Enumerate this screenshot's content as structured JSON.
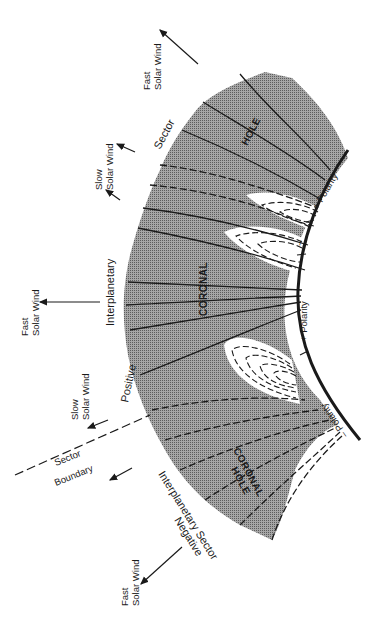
{
  "diagram": {
    "type": "coronal-magnetic-field-schematic",
    "colors": {
      "background": "#ffffff",
      "corona_fill": "#8e8e8e",
      "streamer_fill": "#ffffff",
      "ink": "#1a1a1a"
    },
    "labels": {
      "fast_wind_top": [
        "Fast",
        "Solar Wind"
      ],
      "sector_word": "Sector",
      "slow_wind_upper": [
        "Slow",
        "Solar Wind"
      ],
      "interplanetary_word": "Interplanetary",
      "fast_wind_middle": [
        "Fast",
        "Solar Wind"
      ],
      "positive_word": "Positive",
      "slow_wind_lower": [
        "Slow",
        "Solar Wind"
      ],
      "sector_boundary": [
        "Sector",
        "Boundary"
      ],
      "negative_sector": [
        "Negative",
        "Interplanetary Sector"
      ],
      "fast_wind_bottom": [
        "Fast",
        "Solar Wind"
      ],
      "hole_upper": "HOLE",
      "coronal_middle": "CORONAL",
      "coronal_hole_lower": [
        "CORONAL",
        "HOLE"
      ],
      "polarity_plus_upper": "+ Polarity",
      "polarity_minus_mark": "–",
      "polarity_plus_middle": "+ Polarity",
      "polarity_minus_lower": "– Polarity"
    },
    "elements": {
      "solar_surface": "arc-right",
      "streamers": 3,
      "arrows": [
        {
          "name": "fast-solar-wind-top",
          "direction": "up-left"
        },
        {
          "name": "slow-solar-wind-upper-1",
          "direction": "up-left"
        },
        {
          "name": "slow-solar-wind-upper-2",
          "direction": "up-left"
        },
        {
          "name": "fast-solar-wind-middle",
          "direction": "left"
        },
        {
          "name": "slow-solar-wind-lower-1",
          "direction": "down-left"
        },
        {
          "name": "slow-solar-wind-lower-2",
          "direction": "down-left"
        },
        {
          "name": "fast-solar-wind-bottom",
          "direction": "down-left"
        }
      ]
    }
  }
}
